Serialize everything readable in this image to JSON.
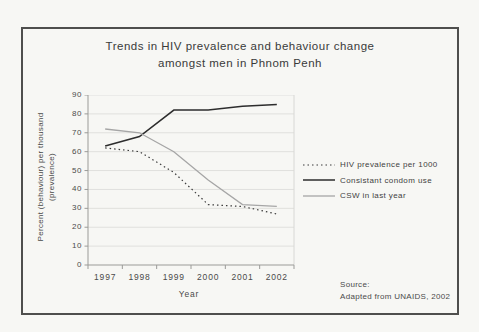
{
  "figure": {
    "title_line1": "Trends in HIV prevalence and behaviour change",
    "title_line2": "amongst men in Phnom Penh",
    "y_axis_title_line1": "Percent (behaviour) per thousand",
    "y_axis_title_line2": "(prevalence)",
    "x_axis_title": "Year",
    "source_line1": "Source:",
    "source_line2": "Adapted from UNAIDS, 2002"
  },
  "chart_data": {
    "type": "line",
    "title": "Trends in HIV prevalence and behaviour change amongst men in Phnom Penh",
    "xlabel": "Year",
    "ylabel": "Percent (behaviour) per thousand (prevalence)",
    "categories": [
      "1997",
      "1998",
      "1999",
      "2000",
      "2001",
      "2002"
    ],
    "ylim": [
      0,
      90
    ],
    "ytick_step": 10,
    "grid": true,
    "legend_position": "right",
    "series": [
      {
        "name": "HIV prevalence per 1000",
        "style": "dotted",
        "color": "#3a3a3a",
        "width": 1.2,
        "values": [
          62,
          60,
          49,
          32,
          31,
          27
        ]
      },
      {
        "name": "Consistant condom use",
        "style": "solid",
        "color": "#2d2d2d",
        "width": 1.5,
        "values": [
          63,
          68,
          82,
          82,
          84,
          85
        ]
      },
      {
        "name": "CSW in last year",
        "style": "solid",
        "color": "#a6a6a6",
        "width": 1.3,
        "values": [
          72,
          70,
          60,
          45,
          32,
          31
        ]
      }
    ]
  },
  "colors": {
    "background": "#f7f7f4",
    "frame_border": "#4f4f4d",
    "grid": "#e0e0dd",
    "plot_border": "#d8d8d5",
    "axis": "#9b9b98",
    "text": "#3b3b3b"
  }
}
